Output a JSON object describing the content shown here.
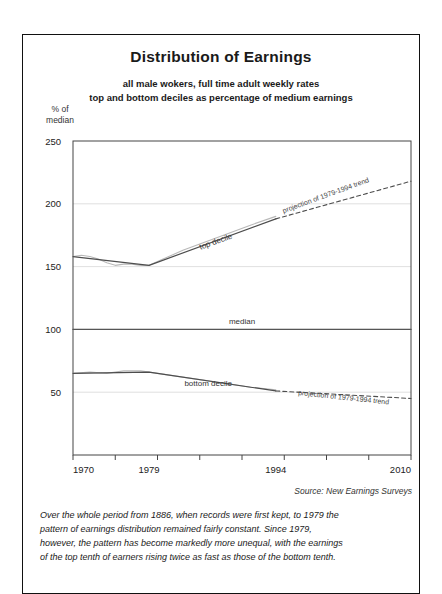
{
  "frame": {
    "border_color": "#111111"
  },
  "header": {
    "title": "Distribution of Earnings",
    "subtitle_1": "all male wokers, full time adult weekly rates",
    "subtitle_2": "top and bottom deciles as percentage of medium earnings"
  },
  "axis_label": {
    "line_1": "% of",
    "line_2": "median"
  },
  "footer": {
    "source": "Source: New Earnings Surveys",
    "caption_line_1": "Over the whole period from 1886, when records were first kept, to 1979 the",
    "caption_line_2": "pattern of earnings distribution remained fairly constant. Since 1979,",
    "caption_line_3": "however, the pattern has become markedly more unequal, with the earnings",
    "caption_line_4": "of the top tenth of earners rising twice as fast as those of the bottom tenth."
  },
  "chart_data": {
    "type": "line",
    "title": "Distribution of Earnings",
    "subtitle": "all male wokers, full time adult weekly rates; top and bottom deciles as percentage of medium earnings",
    "xlabel": "",
    "ylabel": "% of median",
    "xlim": [
      1970,
      2010
    ],
    "ylim": [
      0,
      250
    ],
    "yticks": [
      50,
      100,
      150,
      200,
      250
    ],
    "ytick_labels": [
      "50",
      "100",
      "150",
      "200",
      "250"
    ],
    "xticks": [
      1970,
      1975,
      1980,
      1985,
      1990,
      1995,
      2000,
      2005,
      2010
    ],
    "xtick_labels_shown": [
      "1970",
      "1979",
      "1994",
      "2010"
    ],
    "xtick_labels_shown_at": [
      1970,
      1979,
      1994,
      2010
    ],
    "grid": "horizontal",
    "legend_position": "inline-annotations",
    "colors": {
      "actual": "#b8b8b8",
      "trend": "#4d4d4d",
      "median": "#555555",
      "grid": "#d8d8d8"
    },
    "series": [
      {
        "name": "top decile",
        "style": "solid",
        "segment": "observed",
        "x": [
          1970,
          1971,
          1972,
          1973,
          1974,
          1975,
          1976,
          1977,
          1978,
          1979,
          1981,
          1983,
          1985,
          1987,
          1989,
          1991,
          1994
        ],
        "values": [
          158,
          159,
          158,
          156,
          153,
          151,
          152,
          152,
          151,
          151,
          157,
          163,
          168,
          173,
          178,
          183,
          190
        ]
      },
      {
        "name": "top decile trend",
        "style": "solid",
        "segment": "fitted",
        "x": [
          1970,
          1979,
          1994
        ],
        "values": [
          158,
          151,
          188
        ]
      },
      {
        "name": "projection of 1979-1994 trend (top decile)",
        "style": "dashed",
        "segment": "projection",
        "x": [
          1994,
          2010
        ],
        "values": [
          188,
          218
        ]
      },
      {
        "name": "median",
        "style": "solid",
        "segment": "reference",
        "x": [
          1970,
          2010
        ],
        "values": [
          100,
          100
        ]
      },
      {
        "name": "bottom decile",
        "style": "solid",
        "segment": "observed",
        "x": [
          1970,
          1972,
          1974,
          1975,
          1976,
          1977,
          1978,
          1979,
          1981,
          1983,
          1985,
          1987,
          1989,
          1991,
          1994
        ],
        "values": [
          65,
          66,
          65,
          66,
          67,
          67,
          67,
          66,
          64,
          62,
          60,
          58,
          56,
          54,
          52
        ]
      },
      {
        "name": "bottom decile trend",
        "style": "solid",
        "segment": "fitted",
        "x": [
          1970,
          1979,
          1994
        ],
        "values": [
          65,
          66,
          51
        ]
      },
      {
        "name": "projection of 1979-1994 trend (bottom decile)",
        "style": "dashed",
        "segment": "projection",
        "x": [
          1994,
          2010
        ],
        "values": [
          51,
          45
        ]
      }
    ],
    "annotations": [
      {
        "text": "top decile",
        "x": 1987,
        "y": 168,
        "rotation": -20
      },
      {
        "text": "projection of 1979-1994 trend",
        "x": 2000,
        "y": 205,
        "rotation": -20
      },
      {
        "text": "median",
        "x": 1990,
        "y": 104,
        "rotation": 0
      },
      {
        "text": "bottom decile",
        "x": 1986,
        "y": 55,
        "rotation": 0
      },
      {
        "text": "projection of 1979-1994 trend",
        "x": 2002,
        "y": 44,
        "rotation": 6
      }
    ]
  }
}
